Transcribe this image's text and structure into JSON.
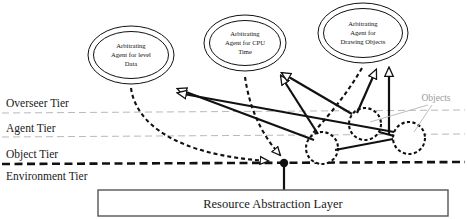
{
  "diagram": {
    "tiers": [
      {
        "id": "overseer",
        "label": "Overseer Tier"
      },
      {
        "id": "agent",
        "label": "Agent Tier"
      },
      {
        "id": "object",
        "label": "Object Tier"
      },
      {
        "id": "environment",
        "label": "Environment Tier"
      }
    ],
    "agents": [
      {
        "id": "level-data",
        "lines": [
          "Arbitrating",
          "Agent for level",
          "Data"
        ]
      },
      {
        "id": "cpu-time",
        "lines": [
          "Arbitrating",
          "Agent for CPU",
          "Time"
        ]
      },
      {
        "id": "drawing-objects",
        "lines": [
          "Arbitrating",
          "Agent for",
          "Drawing Objects"
        ]
      }
    ],
    "objects_label": "Objects",
    "resource_layer": "Resource Abstraction Layer",
    "colors": {
      "ink": "#111111",
      "tier_thin": "#b9b9b9",
      "objects_gray": "#9a9a9a",
      "box_stroke": "#555555",
      "background": "#ffffff"
    }
  }
}
